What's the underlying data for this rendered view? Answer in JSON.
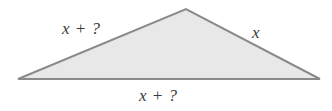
{
  "figure": {
    "kind": "triangle-diagram",
    "background_color": "#ffffff",
    "fill_color": "#e8e8e8",
    "stroke_color": "#8a8a8a",
    "stroke_width": 2,
    "text_color": "#3a3a3a",
    "vertices": {
      "left": {
        "x": 18,
        "y": 79
      },
      "apex": {
        "x": 186,
        "y": 9
      },
      "right": {
        "x": 320,
        "y": 79
      }
    },
    "polygon_points": "18,79 186,9 320,79",
    "labels": {
      "left_side": "x + ?",
      "right_side": "x",
      "base_side": "x + ?"
    }
  }
}
